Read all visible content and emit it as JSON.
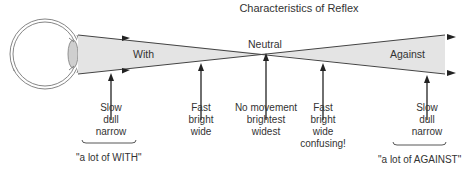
{
  "title": "Characteristics of Reflex",
  "beam": {
    "left_label": "With",
    "center_label": "Neutral",
    "right_label": "Against",
    "fill_color": "#e4e4e4",
    "stroke_color": "#444444"
  },
  "annotations": [
    {
      "id": "slow-with",
      "lines": [
        "Slow",
        "dull",
        "narrow"
      ]
    },
    {
      "id": "fast-with",
      "lines": [
        "Fast",
        "bright",
        "wide"
      ]
    },
    {
      "id": "neutral",
      "lines": [
        "No movement",
        "brightest",
        "widest"
      ]
    },
    {
      "id": "fast-against",
      "lines": [
        "Fast",
        "bright",
        "wide",
        "confusing!"
      ]
    },
    {
      "id": "slow-against",
      "lines": [
        "Slow",
        "dull",
        "narrow"
      ]
    }
  ],
  "brackets": {
    "left": "\"a lot of WITH\"",
    "right": "\"a lot of AGAINST\""
  }
}
